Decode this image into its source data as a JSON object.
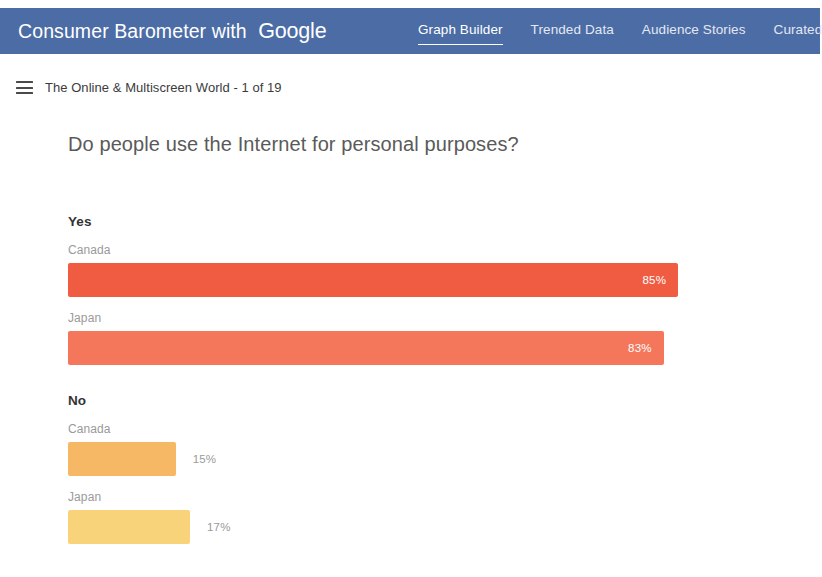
{
  "header": {
    "brand_prefix": "Consumer Barometer with",
    "brand_google": "Google",
    "brand_color": "#4c6ca5",
    "nav": [
      {
        "label": "Graph Builder",
        "active": true
      },
      {
        "label": "Trended Data",
        "active": false
      },
      {
        "label": "Audience Stories",
        "active": false
      },
      {
        "label": "Curated",
        "active": false
      }
    ]
  },
  "breadcrumb": {
    "menu_icon": "hamburger-icon",
    "text": "The Online & Multiscreen World - 1 of 19"
  },
  "question": "Do people use the Internet for personal purposes?",
  "chart_data": {
    "type": "bar",
    "title": "Do people use the Internet for personal purposes?",
    "orientation": "horizontal",
    "xlabel": "",
    "ylabel": "",
    "xlim": [
      0,
      100
    ],
    "grid": false,
    "legend": "none",
    "value_suffix": "%",
    "categories": [
      "Canada",
      "Japan"
    ],
    "groups": [
      {
        "answer": "Yes",
        "bars": [
          {
            "category": "Canada",
            "value": 85,
            "label": "85%",
            "color": "#f05c42",
            "label_position": "inside"
          },
          {
            "category": "Japan",
            "value": 83,
            "label": "83%",
            "color": "#f4775c",
            "label_position": "inside"
          }
        ]
      },
      {
        "answer": "No",
        "bars": [
          {
            "category": "Canada",
            "value": 15,
            "label": "15%",
            "color": "#f7b866",
            "label_position": "outside"
          },
          {
            "category": "Japan",
            "value": 17,
            "label": "17%",
            "color": "#f9d37a",
            "label_position": "outside"
          }
        ]
      }
    ]
  }
}
